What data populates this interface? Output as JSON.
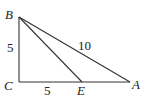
{
  "diagram": {
    "type": "geometry-right-triangle",
    "points": [
      {
        "name": "B",
        "label": "B",
        "x": 19,
        "y": 17
      },
      {
        "name": "C",
        "label": "C",
        "x": 19,
        "y": 82
      },
      {
        "name": "E",
        "label": "E",
        "x": 82,
        "y": 82
      },
      {
        "name": "A",
        "label": "A",
        "x": 130,
        "y": 82
      }
    ],
    "segments": [
      {
        "from": "B",
        "to": "C"
      },
      {
        "from": "C",
        "to": "A"
      },
      {
        "from": "B",
        "to": "A"
      },
      {
        "from": "B",
        "to": "E"
      }
    ],
    "length_labels": {
      "BC": "5",
      "CE": "5",
      "AB": "10"
    },
    "stroke_color": "#333333"
  }
}
